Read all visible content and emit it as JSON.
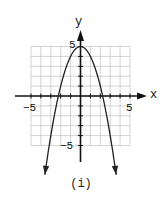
{
  "chart_data": {
    "type": "line",
    "title": "",
    "caption": "(i)",
    "xlabel": "x",
    "ylabel": "y",
    "xlim": [
      -5,
      5
    ],
    "ylim": [
      -5,
      5
    ],
    "grid": true,
    "x_tick_labels": [
      {
        "value": -5,
        "label": "−5"
      },
      {
        "value": 5,
        "label": "5"
      }
    ],
    "y_tick_labels": [
      {
        "value": 5,
        "label": "5"
      },
      {
        "value": -5,
        "label": "−5"
      }
    ],
    "series": [
      {
        "name": "y = 5 - x^2",
        "function": "5 - x^2",
        "x": [
          -3.6,
          -3,
          -2.5,
          -2,
          -1.5,
          -1,
          -0.5,
          0,
          0.5,
          1,
          1.5,
          2,
          2.5,
          3,
          3.6
        ],
        "values": [
          -7.96,
          -4,
          -1.25,
          1,
          2.75,
          4,
          4.75,
          5,
          4.75,
          4,
          2.75,
          1,
          -1.25,
          -4,
          -7.96
        ],
        "arrows_at_ends": true
      }
    ],
    "legend": null
  },
  "labels": {
    "x_axis": "x",
    "y_axis": "y",
    "x_neg5": "−5",
    "x_pos5": "5",
    "y_pos5": "5",
    "y_neg5": "−5",
    "caption": "(i)"
  },
  "colors": {
    "grid": "#c8c8c8",
    "axis": "#111111",
    "curve": "#222222"
  }
}
